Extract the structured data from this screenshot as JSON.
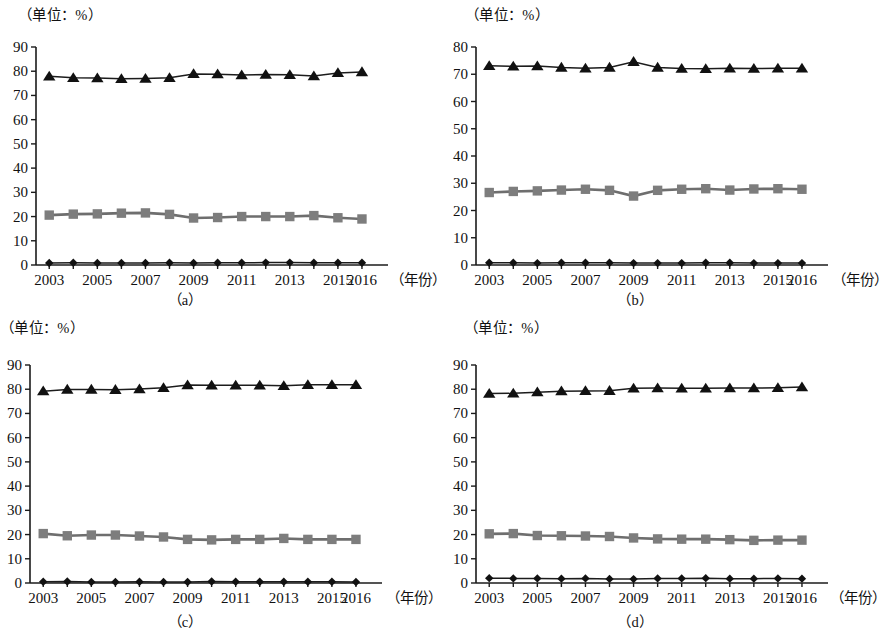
{
  "figure": {
    "unit_label": "（单位：%）",
    "year_axis_label": "（年份）",
    "captions": {
      "a": "（a）",
      "b": "（b）",
      "c": "（c）",
      "d": "（d）"
    }
  },
  "chart_data": [
    {
      "id": "a",
      "type": "line",
      "title": "",
      "caption": "（a）",
      "xlabel": "（年份）",
      "ylabel": "（单位：%）",
      "x": [
        2003,
        2004,
        2005,
        2006,
        2007,
        2008,
        2009,
        2010,
        2011,
        2012,
        2013,
        2014,
        2015,
        2016
      ],
      "xtick_labels": [
        "2003",
        "2005",
        "2007",
        "2009",
        "2011",
        "2013",
        "2015",
        "2016"
      ],
      "xtick_values": [
        2003,
        2005,
        2007,
        2009,
        2011,
        2013,
        2015,
        2016
      ],
      "ylim": [
        0,
        90
      ],
      "yticks": [
        0,
        10,
        20,
        30,
        40,
        50,
        60,
        70,
        80,
        90
      ],
      "grid": false,
      "legend": "none",
      "series": [
        {
          "name": "triangle-series",
          "marker": "triangle",
          "color": "#111111",
          "values": [
            77.9,
            77.3,
            77.2,
            76.9,
            77.0,
            77.3,
            78.9,
            78.8,
            78.4,
            78.6,
            78.5,
            78.0,
            79.3,
            79.7
          ]
        },
        {
          "name": "square-series",
          "marker": "square",
          "color": "#7d7d7d",
          "values": [
            20.6,
            21.0,
            21.1,
            21.4,
            21.5,
            20.9,
            19.4,
            19.6,
            20.0,
            20.0,
            20.0,
            20.4,
            19.5,
            19.0
          ]
        },
        {
          "name": "diamond-series",
          "marker": "diamond",
          "color": "#111111",
          "values": [
            0.8,
            0.9,
            0.8,
            0.8,
            0.8,
            0.9,
            0.8,
            0.9,
            0.9,
            1.0,
            1.0,
            0.9,
            0.9,
            0.9
          ]
        }
      ]
    },
    {
      "id": "b",
      "type": "line",
      "title": "",
      "caption": "（b）",
      "xlabel": "（年份）",
      "ylabel": "（单位：%）",
      "x": [
        2003,
        2004,
        2005,
        2006,
        2007,
        2008,
        2009,
        2010,
        2011,
        2012,
        2013,
        2014,
        2015,
        2016
      ],
      "xtick_labels": [
        "2003",
        "2005",
        "2007",
        "2009",
        "2011",
        "2013",
        "2015",
        "2016"
      ],
      "xtick_values": [
        2003,
        2005,
        2007,
        2009,
        2011,
        2013,
        2015,
        2016
      ],
      "ylim": [
        0,
        80
      ],
      "yticks": [
        0,
        10,
        20,
        30,
        40,
        50,
        60,
        70,
        80
      ],
      "grid": false,
      "legend": "none",
      "series": [
        {
          "name": "triangle-series",
          "marker": "triangle",
          "color": "#111111",
          "values": [
            73.1,
            72.9,
            73.0,
            72.5,
            72.2,
            72.5,
            74.6,
            72.5,
            72.1,
            72.0,
            72.2,
            72.1,
            72.2,
            72.2
          ]
        },
        {
          "name": "square-series",
          "marker": "square",
          "color": "#7d7d7d",
          "values": [
            26.6,
            27.0,
            27.2,
            27.5,
            27.8,
            27.4,
            25.3,
            27.4,
            27.8,
            28.0,
            27.5,
            27.9,
            28.0,
            27.8
          ]
        },
        {
          "name": "diamond-series",
          "marker": "diamond",
          "color": "#111111",
          "values": [
            0.8,
            0.8,
            0.7,
            0.8,
            0.8,
            0.8,
            0.7,
            0.7,
            0.7,
            0.8,
            0.8,
            0.7,
            0.7,
            0.7
          ]
        }
      ]
    },
    {
      "id": "c",
      "type": "line",
      "title": "",
      "caption": "（c）",
      "xlabel": "（年份）",
      "ylabel": "（单位：%）",
      "x": [
        2003,
        2004,
        2005,
        2006,
        2007,
        2008,
        2009,
        2010,
        2011,
        2012,
        2013,
        2014,
        2015,
        2016
      ],
      "xtick_labels": [
        "2003",
        "2005",
        "2007",
        "2009",
        "2011",
        "2013",
        "2015",
        "2016"
      ],
      "xtick_values": [
        2003,
        2005,
        2007,
        2009,
        2011,
        2013,
        2015,
        2016
      ],
      "ylim": [
        0,
        90
      ],
      "yticks": [
        0,
        10,
        20,
        30,
        40,
        50,
        60,
        70,
        80,
        90
      ],
      "grid": false,
      "legend": "none",
      "series": [
        {
          "name": "triangle-series",
          "marker": "triangle",
          "color": "#111111",
          "values": [
            79.2,
            79.9,
            79.9,
            79.8,
            80.1,
            80.6,
            81.7,
            81.6,
            81.6,
            81.6,
            81.4,
            81.8,
            81.8,
            81.8
          ]
        },
        {
          "name": "square-series",
          "marker": "square",
          "color": "#7d7d7d",
          "values": [
            20.4,
            19.5,
            19.8,
            19.8,
            19.4,
            19.0,
            18.0,
            17.8,
            18.0,
            18.0,
            18.4,
            18.0,
            18.0,
            18.0
          ]
        },
        {
          "name": "diamond-series",
          "marker": "diamond",
          "color": "#111111",
          "values": [
            0.5,
            0.6,
            0.4,
            0.4,
            0.5,
            0.4,
            0.4,
            0.6,
            0.5,
            0.5,
            0.5,
            0.5,
            0.5,
            0.4
          ]
        }
      ]
    },
    {
      "id": "d",
      "type": "line",
      "title": "",
      "caption": "（d）",
      "xlabel": "（年份）",
      "ylabel": "（单位：%）",
      "x": [
        2003,
        2004,
        2005,
        2006,
        2007,
        2008,
        2009,
        2010,
        2011,
        2012,
        2013,
        2014,
        2015,
        2016
      ],
      "xtick_labels": [
        "2003",
        "2005",
        "2007",
        "2009",
        "2011",
        "2013",
        "2015",
        "2016"
      ],
      "xtick_values": [
        2003,
        2005,
        2007,
        2009,
        2011,
        2013,
        2015,
        2016
      ],
      "ylim": [
        0,
        90
      ],
      "yticks": [
        0,
        10,
        20,
        30,
        40,
        50,
        60,
        70,
        80,
        90
      ],
      "grid": false,
      "legend": "none",
      "series": [
        {
          "name": "triangle-series",
          "marker": "triangle",
          "color": "#111111",
          "values": [
            78.2,
            78.3,
            78.8,
            79.2,
            79.3,
            79.4,
            80.4,
            80.5,
            80.4,
            80.4,
            80.5,
            80.5,
            80.6,
            80.9
          ]
        },
        {
          "name": "square-series",
          "marker": "square",
          "color": "#7d7d7d",
          "values": [
            20.3,
            20.4,
            19.6,
            19.5,
            19.4,
            19.2,
            18.6,
            18.2,
            18.1,
            18.1,
            17.9,
            17.6,
            17.7,
            17.7
          ]
        },
        {
          "name": "diamond-series",
          "marker": "diamond",
          "color": "#111111",
          "values": [
            2.0,
            1.9,
            1.9,
            1.8,
            1.9,
            1.7,
            1.6,
            1.9,
            1.9,
            2.0,
            1.8,
            1.8,
            1.9,
            1.8
          ]
        }
      ]
    }
  ]
}
